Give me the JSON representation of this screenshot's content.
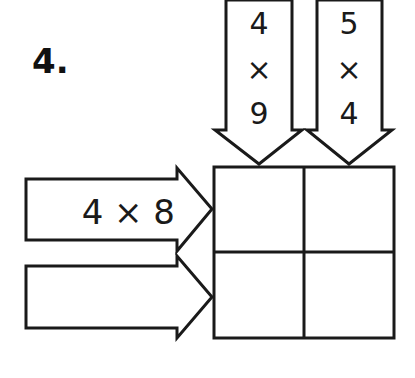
{
  "problem": {
    "number_label": "4."
  },
  "column_arrows": [
    {
      "top": "4",
      "op": "×",
      "bottom": "9"
    },
    {
      "top": "5",
      "op": "×",
      "bottom": "4"
    }
  ],
  "row_arrows": [
    {
      "expression": "4 × 8"
    },
    {
      "expression": ""
    }
  ],
  "grid": {
    "rows": 2,
    "cols": 2,
    "cells": [
      [
        "",
        ""
      ],
      [
        "",
        ""
      ]
    ]
  },
  "colors": {
    "stroke": "#1a1a1a",
    "background": "#ffffff"
  }
}
